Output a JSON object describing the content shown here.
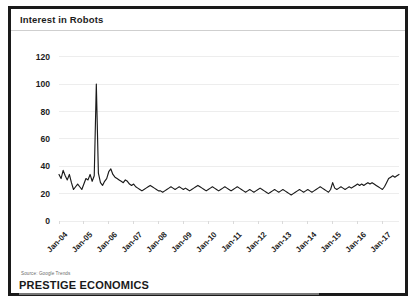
{
  "figure": {
    "title": "Interest in Robots",
    "source_note": "Source: Google Trends",
    "brand": "PRESTIGE ECONOMICS"
  },
  "chart_data": {
    "type": "line",
    "title": "Interest in Robots",
    "xlabel": "",
    "ylabel": "",
    "ylim": [
      0,
      130
    ],
    "yticks": [
      0,
      20,
      40,
      60,
      80,
      100,
      120
    ],
    "ytick_labels": [
      "0",
      "20",
      "40",
      "60",
      "80",
      "100",
      "120"
    ],
    "grid": true,
    "legend": "none",
    "series_color": "#1a1a1a",
    "x_tick_labels": [
      "Jan-04",
      "Jan-05",
      "Jan-06",
      "Jan-07",
      "Jan-08",
      "Jan-09",
      "Jan-10",
      "Jan-11",
      "Jan-12",
      "Jan-13",
      "Jan-14",
      "Jan-15",
      "Jan-16",
      "Jan-17"
    ],
    "x_start": "Jan-04",
    "x_end": "Jan-17",
    "x_frequency": "monthly",
    "series": [
      {
        "name": "Interest in Robots",
        "values": [
          34,
          31,
          37,
          33,
          30,
          34,
          28,
          23,
          25,
          27,
          25,
          23,
          27,
          31,
          30,
          34,
          29,
          33,
          100,
          35,
          28,
          26,
          29,
          31,
          36,
          38,
          34,
          32,
          31,
          30,
          29,
          28,
          30,
          29,
          27,
          26,
          27,
          25,
          24,
          23,
          22,
          23,
          24,
          25,
          26,
          25,
          24,
          23,
          22,
          22,
          21,
          22,
          23,
          24,
          25,
          24,
          23,
          24,
          25,
          24,
          23,
          24,
          23,
          22,
          23,
          24,
          25,
          26,
          25,
          24,
          23,
          22,
          23,
          24,
          25,
          24,
          23,
          22,
          23,
          24,
          25,
          24,
          23,
          22,
          23,
          24,
          25,
          24,
          23,
          22,
          21,
          22,
          23,
          22,
          21,
          22,
          23,
          24,
          23,
          22,
          21,
          20,
          21,
          22,
          23,
          22,
          21,
          22,
          23,
          22,
          21,
          20,
          19,
          20,
          21,
          22,
          23,
          22,
          21,
          22,
          23,
          22,
          21,
          22,
          23,
          24,
          25,
          24,
          23,
          22,
          21,
          23,
          28,
          24,
          23,
          24,
          25,
          24,
          23,
          24,
          25,
          24,
          25,
          26,
          27,
          26,
          27,
          26,
          27,
          28,
          27,
          28,
          27,
          26,
          25,
          24,
          23,
          25,
          28,
          31,
          32,
          33,
          32,
          33,
          34
        ]
      }
    ],
    "annotations": [
      {
        "label": "peak",
        "x": "Jul-05",
        "y": 100
      }
    ]
  }
}
